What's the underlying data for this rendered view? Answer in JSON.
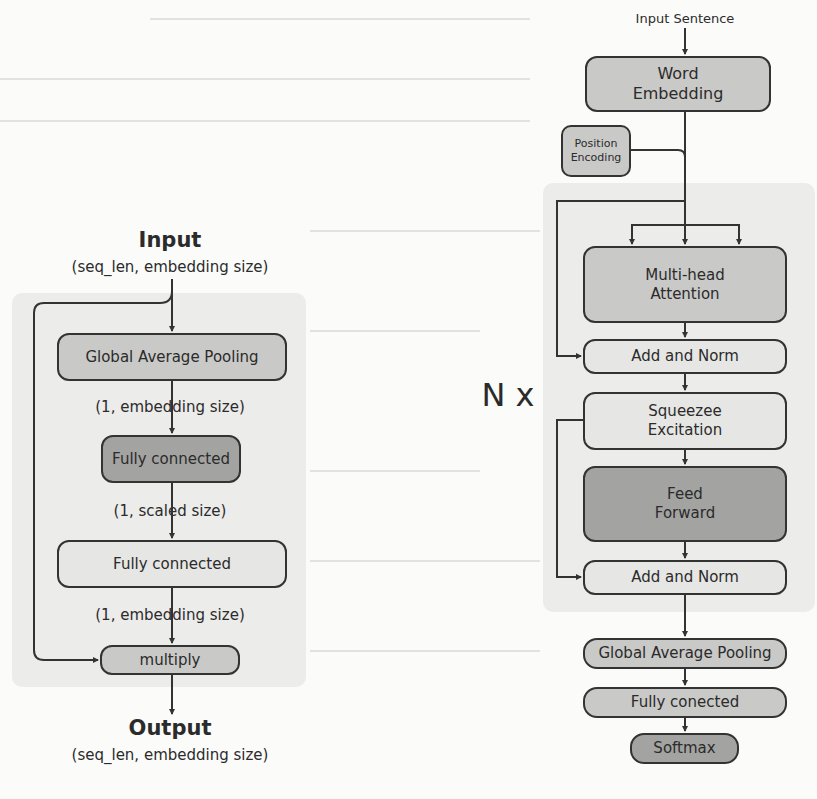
{
  "left_diagram": {
    "input_title": "Input",
    "input_shape": "(seq_len, embedding size)",
    "nodes": [
      {
        "label": "Global Average Pooling",
        "shade": "mid"
      },
      {
        "label": "Fully connected",
        "shade": "dark"
      },
      {
        "label": "Fully connected",
        "shade": "light"
      },
      {
        "label": "multiply",
        "shade": "mid"
      }
    ],
    "edge_labels": [
      "(1, embedding size)",
      "(1, scaled size)",
      "(1, embedding size)"
    ],
    "output_title": "Output",
    "output_shape": "(seq_len, embedding size)"
  },
  "right_diagram": {
    "input_label": "Input Sentence",
    "word_embedding": "Word\nEmbedding",
    "position_encoding": "Position\nEncoding",
    "repeat_label": "N x",
    "block_nodes": [
      {
        "label": "Multi-head\nAttention",
        "shade": "mid"
      },
      {
        "label": "Add and Norm",
        "shade": "light"
      },
      {
        "label": "Squeezee\nExcitation",
        "shade": "light"
      },
      {
        "label": "Feed\nForward",
        "shade": "dark"
      },
      {
        "label": "Add and Norm",
        "shade": "light"
      }
    ],
    "head_nodes": [
      {
        "label": "Global Average Pooling",
        "shade": "mid"
      },
      {
        "label": "Fully conected",
        "shade": "mid"
      },
      {
        "label": "Softmax",
        "shade": "dark"
      }
    ]
  },
  "colors": {
    "background": "#fbfbfa",
    "panel": "#ececea",
    "node_light": "#e6e6e4",
    "node_mid": "#c9c9c7",
    "node_dark": "#a3a3a1",
    "stroke": "#333333"
  }
}
